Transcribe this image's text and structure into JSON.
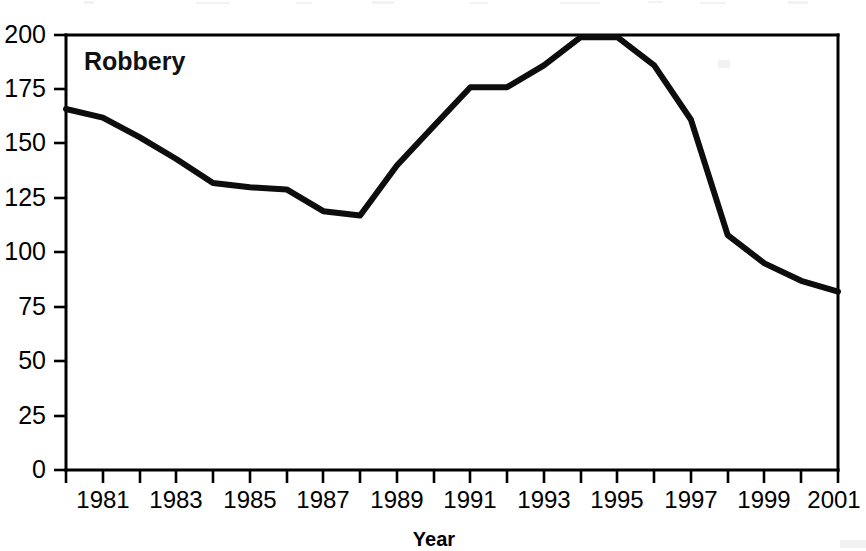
{
  "chart_data": {
    "type": "line",
    "title": "",
    "series_label": "Robbery",
    "xlabel": "Year",
    "ylabel": "",
    "xlim": [
      1980,
      2001
    ],
    "ylim": [
      0,
      200
    ],
    "grid": false,
    "legend_position": "none",
    "x": [
      1980,
      1981,
      1982,
      1983,
      1984,
      1985,
      1986,
      1987,
      1988,
      1989,
      1990,
      1991,
      1992,
      1993,
      1994,
      1995,
      1996,
      1997,
      1998,
      1999,
      2000,
      2001
    ],
    "values": [
      166,
      162,
      153,
      143,
      132,
      130,
      129,
      119,
      117,
      140,
      158,
      176,
      176,
      186,
      199,
      199,
      186,
      161,
      108,
      95,
      87,
      82
    ],
    "series": [
      {
        "name": "Robbery",
        "values": [
          166,
          162,
          153,
          143,
          132,
          130,
          129,
          119,
          117,
          140,
          158,
          176,
          176,
          186,
          199,
          199,
          186,
          161,
          108,
          95,
          87,
          82
        ]
      }
    ],
    "y_ticks": [
      0,
      25,
      50,
      75,
      100,
      125,
      150,
      175,
      200
    ],
    "y_tick_labels": [
      "0",
      "25",
      "50",
      "75",
      "100",
      "125",
      "150",
      "175",
      "200"
    ],
    "x_ticks": [
      1980,
      1981,
      1982,
      1983,
      1984,
      1985,
      1986,
      1987,
      1988,
      1989,
      1990,
      1991,
      1992,
      1993,
      1994,
      1995,
      1996,
      1997,
      1998,
      1999,
      2000,
      2001
    ],
    "x_tick_labels": [
      "",
      "1981",
      "",
      "1983",
      "",
      "1985",
      "",
      "1987",
      "",
      "1989",
      "",
      "1991",
      "",
      "1993",
      "",
      "1995",
      "",
      "1997",
      "",
      "1999",
      "",
      "2001"
    ],
    "line_color": "#0d0d0d",
    "background_color": "#ffffff"
  }
}
